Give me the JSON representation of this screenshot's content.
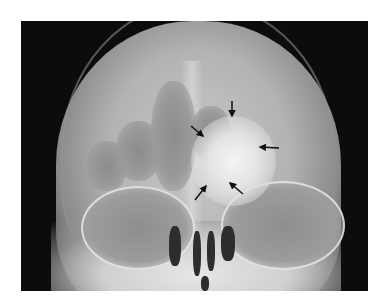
{
  "image": {
    "type": "radiograph",
    "view": "frontal skull X-ray",
    "description": "Grayscale skull radiograph with a bright opaque mass near the frontal/ethmoid region indicated by five black arrows",
    "colors": {
      "background": "#ffffff",
      "film_dark": "#0c0c0c",
      "bone": "#c9c9c9",
      "lesion": "#f4f4f4",
      "arrow": "#111111"
    },
    "arrows": [
      {
        "name": "arrow-top",
        "direction": "down",
        "tip": [
          232,
          116
        ]
      },
      {
        "name": "arrow-upper-left",
        "direction": "down-right",
        "tip": [
          203,
          136
        ]
      },
      {
        "name": "arrow-right",
        "direction": "left",
        "tip": [
          260,
          147
        ]
      },
      {
        "name": "arrow-lower-left",
        "direction": "up-right",
        "tip": [
          206,
          186
        ]
      },
      {
        "name": "arrow-lower-right",
        "direction": "up-left",
        "tip": [
          230,
          183
        ]
      }
    ]
  }
}
